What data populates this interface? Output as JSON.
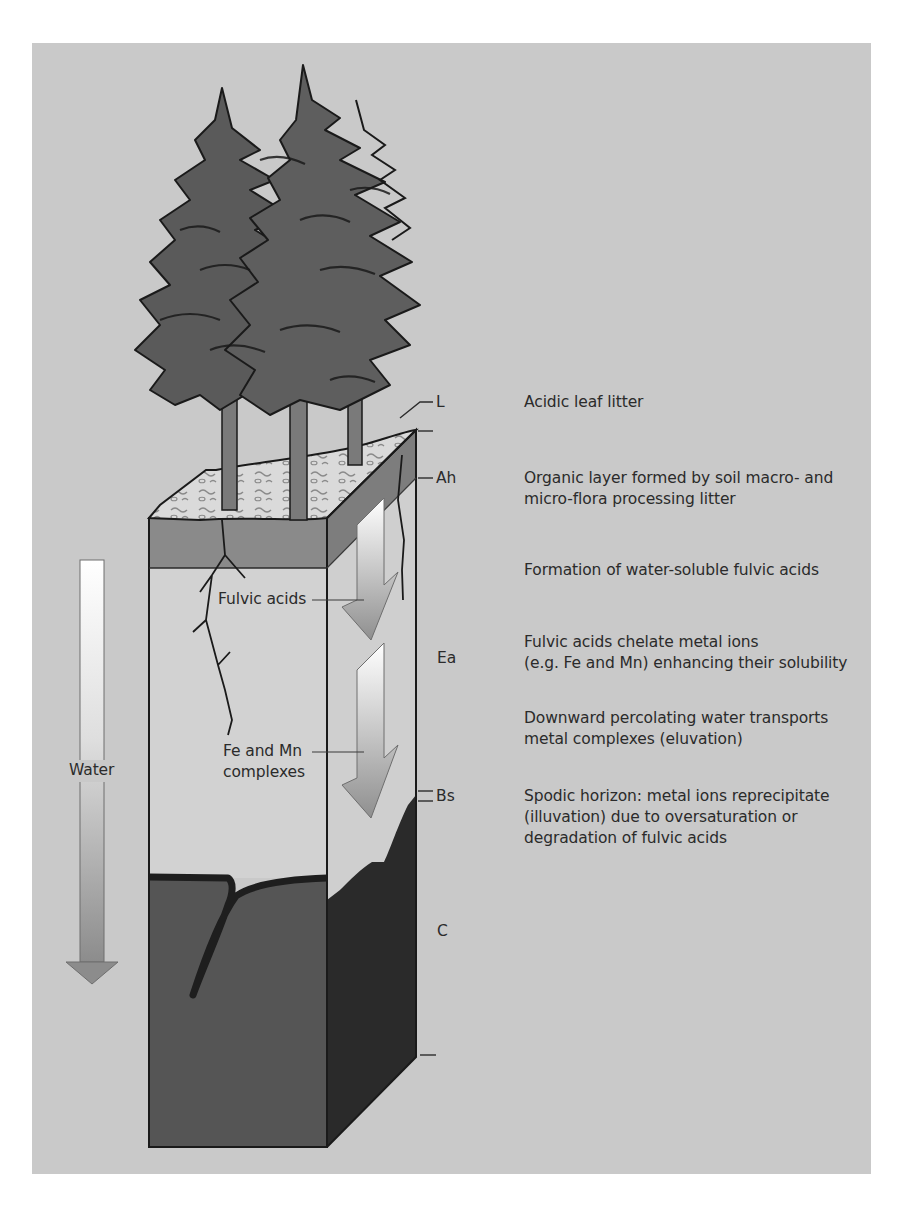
{
  "diagram": {
    "title": "",
    "colors": {
      "panel_bg": "#c9c9c9",
      "page_bg": "#ffffff",
      "tree_foliage": "#5a5a5a",
      "litter_surface": "#d9d9d9",
      "ah_layer": "#8a8a8a",
      "ea_layer": "#d2d2d2",
      "c_front": "#555555",
      "c_side": "#2b2b2b",
      "text": "#2b2b2b"
    },
    "water_arrow": {
      "label": "Water"
    },
    "inner_labels": {
      "fulvic_acids": "Fulvic acids",
      "fe_mn_line1": "Fe and Mn",
      "fe_mn_line2": "complexes"
    },
    "horizons": [
      {
        "code": "L",
        "description": [
          "Acidic leaf litter"
        ]
      },
      {
        "code": "Ah",
        "description": [
          "Organic layer formed by soil macro- and",
          "micro-flora processing litter"
        ]
      },
      {
        "code": "",
        "description": [
          "Formation of water-soluble fulvic acids"
        ]
      },
      {
        "code": "Ea",
        "description": [
          "Fulvic acids chelate metal ions",
          "(e.g. Fe and Mn) enhancing their solubility"
        ]
      },
      {
        "code": "",
        "description": [
          "Downward percolating water transports",
          "metal complexes (eluvation)"
        ]
      },
      {
        "code": "Bs",
        "description": [
          "Spodic horizon: metal ions  reprecipitate",
          "(illuvation) due to oversaturation or",
          "degradation of fulvic acids"
        ]
      },
      {
        "code": "C",
        "description": []
      }
    ]
  }
}
